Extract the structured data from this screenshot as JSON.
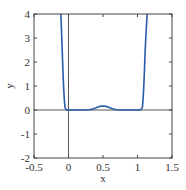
{
  "chart_data": {
    "type": "line",
    "title": "",
    "xlabel": "x",
    "ylabel": "y",
    "xlim": [
      -0.5,
      1.5
    ],
    "ylim": [
      -2,
      4
    ],
    "xticks": [
      -0.5,
      0,
      0.5,
      1,
      1.5
    ],
    "xtick_labels": [
      "-0.5",
      "0",
      "0.5",
      "1",
      "1.5"
    ],
    "yticks": [
      -2,
      -1,
      0,
      1,
      2,
      3,
      4
    ],
    "ytick_labels": [
      "-2",
      "-1",
      "0",
      "1",
      "2",
      "3",
      "4"
    ],
    "grid": false,
    "legend": null,
    "reference_lines": {
      "x": 0,
      "y": 0
    },
    "series": [
      {
        "name": "y(x)",
        "color": "#2a5caa",
        "x": [
          -0.11,
          -0.1,
          -0.09,
          -0.08,
          -0.07,
          -0.06,
          -0.05,
          -0.03,
          0.0,
          0.1,
          0.2,
          0.3,
          0.35,
          0.4,
          0.45,
          0.5,
          0.55,
          0.6,
          0.65,
          0.7,
          0.8,
          0.9,
          1.0,
          1.03,
          1.05,
          1.07,
          1.08,
          1.09,
          1.1,
          1.11,
          1.12,
          1.13,
          1.14
        ],
        "y": [
          4.0,
          3.2,
          2.4,
          1.6,
          0.9,
          0.4,
          0.1,
          0.0,
          0.0,
          0.0,
          0.0,
          0.01,
          0.04,
          0.09,
          0.15,
          0.17,
          0.15,
          0.09,
          0.04,
          0.01,
          0.0,
          0.0,
          0.0,
          0.0,
          0.02,
          0.1,
          0.4,
          0.9,
          1.6,
          2.4,
          3.0,
          3.5,
          4.0
        ]
      }
    ]
  }
}
